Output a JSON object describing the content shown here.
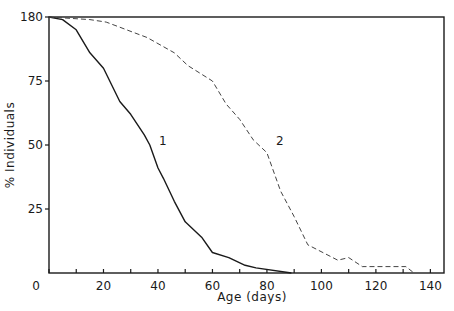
{
  "chart_data": {
    "type": "line",
    "title": "",
    "xlabel": "Age (days)",
    "ylabel": "% Individuals",
    "xlim": [
      0,
      145
    ],
    "ylim": [
      0,
      100
    ],
    "xticks": [
      0,
      20,
      40,
      60,
      80,
      100,
      120,
      140
    ],
    "xticks_minor": [
      10,
      30,
      50,
      70,
      90,
      110,
      130
    ],
    "yticks": [
      0,
      25,
      50,
      75,
      100
    ],
    "ytick_labels": [
      "0",
      "25",
      "50",
      "75",
      "180"
    ],
    "grid": false,
    "legend": "inline labels",
    "series": [
      {
        "name": "1",
        "style": "solid",
        "x": [
          0,
          5,
          10,
          15,
          20,
          26,
          30,
          35,
          37,
          40,
          42,
          46,
          50,
          56,
          60,
          66,
          72,
          76,
          89
        ],
        "y": [
          100,
          99,
          95,
          86,
          80,
          67,
          62,
          54,
          50,
          41,
          37,
          28,
          20,
          14,
          8,
          6,
          3,
          2,
          0
        ]
      },
      {
        "name": "2",
        "style": "dashed",
        "x": [
          0,
          15,
          21,
          26,
          31,
          36,
          46,
          51,
          60,
          65,
          70,
          75,
          80,
          85,
          90,
          95,
          106,
          110,
          115,
          131,
          134
        ],
        "y": [
          100,
          99,
          98,
          96,
          94,
          92,
          86,
          81,
          75,
          66,
          60,
          52,
          47,
          32,
          22,
          11,
          5,
          6,
          2.5,
          2.5,
          0
        ]
      }
    ],
    "annotations": [
      {
        "text": "1",
        "x": 40,
        "y": 50
      },
      {
        "text": "2",
        "x": 83,
        "y": 50
      }
    ]
  }
}
